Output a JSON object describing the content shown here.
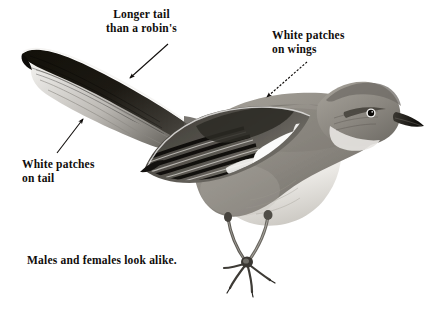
{
  "figure": {
    "background_color": "#ffffff",
    "ink_color": "#100d0b",
    "style": "grayscale field-guide illustration"
  },
  "labels": {
    "longer_tail": "Longer tail\nthan a robin's",
    "white_patches_wings": "White patches\non wings",
    "white_patches_tail": "White patches\non tail",
    "sexes_alike": "Males and females look alike."
  },
  "arrows": [
    {
      "name": "arrow-to-tail",
      "from_label": "longer_tail",
      "x1": 168,
      "y1": 44,
      "x2": 128,
      "y2": 80,
      "head": "end"
    },
    {
      "name": "arrow-to-tail-patch",
      "from_label": "white_patches_tail",
      "x1": 57,
      "y1": 153,
      "x2": 85,
      "y2": 117,
      "head": "end"
    },
    {
      "name": "arrow-to-wing-patch",
      "from_label": "white_patches_wings",
      "x1": 307,
      "y1": 62,
      "x2": 265,
      "y2": 99,
      "head": "end",
      "dashed": true
    }
  ],
  "bird_parts": [
    {
      "name": "tail",
      "tone": "#17140f",
      "note": "long dark tail with white outer feathers"
    },
    {
      "name": "wing",
      "tone": "#4a4742",
      "note": "barred wing with white patch"
    },
    {
      "name": "back",
      "tone": "#8d8a84"
    },
    {
      "name": "head",
      "tone": "#9a968f",
      "note": "eye-ring and dark eye-line"
    },
    {
      "name": "bill",
      "tone": "#1b1814",
      "note": "slender pointed dark bill"
    },
    {
      "name": "breast",
      "tone": "#ebe9e5",
      "note": "pale whitish underparts"
    },
    {
      "name": "legs",
      "tone": "#6a665f",
      "note": "dark slender legs with clawed toes"
    },
    {
      "name": "eye",
      "tone": "#0d0b09"
    }
  ]
}
